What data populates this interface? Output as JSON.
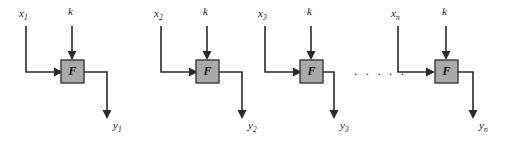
{
  "diagram": {
    "type": "signal-flow-block-diagram",
    "background_color": "#ffffff",
    "wire_color": "#2b2b2b",
    "block_fill_color": "#a9a9a9",
    "block_border_color": "#3a3a3a",
    "block_label": "F",
    "ellipsis": ". . . . .",
    "stages": [
      {
        "id": "stage-1",
        "input_label": "x",
        "input_subscript": "1",
        "param_label": "k",
        "block_label": "F",
        "output_label": "y",
        "output_subscript": "1"
      },
      {
        "id": "stage-2",
        "input_label": "x",
        "input_subscript": "2",
        "param_label": "k",
        "block_label": "F",
        "output_label": "y",
        "output_subscript": "2"
      },
      {
        "id": "stage-3",
        "input_label": "x",
        "input_subscript": "3",
        "param_label": "k",
        "block_label": "F",
        "output_label": "y",
        "output_subscript": "3"
      },
      {
        "id": "stage-n",
        "input_label": "x",
        "input_subscript": "n",
        "param_label": "k",
        "block_label": "F",
        "output_label": "y",
        "output_subscript": "n"
      }
    ]
  }
}
